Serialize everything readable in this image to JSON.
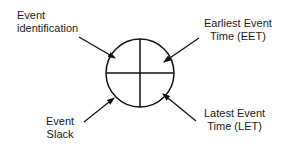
{
  "diagram": {
    "node": {
      "shape": "circle-quadrants",
      "quadrants": [
        "Event identification",
        "Earliest Event Time (EET)",
        "Event Slack",
        "Latest Event Time (LET)"
      ]
    },
    "labels": {
      "top_left": {
        "line1": "Event",
        "line2": "identification"
      },
      "top_right": {
        "line1": "Earliest Event",
        "line2": "Time (EET)"
      },
      "bottom_left": {
        "line1": "Event",
        "line2": "Slack"
      },
      "bottom_right": {
        "line1": "Latest Event",
        "line2": "Time (LET)"
      }
    },
    "colors": {
      "stroke": "#111111",
      "text": "#1a1a1a",
      "background": "#ffffff"
    }
  }
}
